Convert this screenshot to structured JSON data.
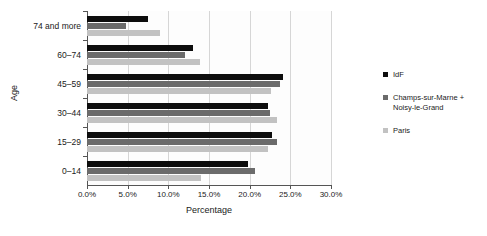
{
  "chart_data": {
    "type": "bar",
    "orientation": "horizontal",
    "title": "",
    "xlabel": "Percentage",
    "ylabel": "Age",
    "categories": [
      "0–14",
      "15–29",
      "30–44",
      "45–59",
      "60–74",
      "74 and more"
    ],
    "xlim": [
      0,
      30
    ],
    "xticks": [
      0,
      5,
      10,
      15,
      20,
      25,
      30
    ],
    "xtick_labels": [
      "0.0%",
      "5.0%",
      "10.0%",
      "15.0%",
      "20.0%",
      "25.0%",
      "30.0%"
    ],
    "grid": true,
    "legend_position": "right",
    "series": [
      {
        "name": "IdF",
        "color": "#0d0d0d",
        "values": [
          19.8,
          22.8,
          22.2,
          24.1,
          13.0,
          7.5
        ]
      },
      {
        "name": "Champs-sur-Marne + Noisy-le-Grand",
        "color": "#6b6b6b",
        "values": [
          20.7,
          23.4,
          22.5,
          23.7,
          12.1,
          4.8
        ]
      },
      {
        "name": "Paris",
        "color": "#c2c2c2",
        "values": [
          14.0,
          22.2,
          23.4,
          22.6,
          13.9,
          9.0
        ]
      }
    ]
  }
}
